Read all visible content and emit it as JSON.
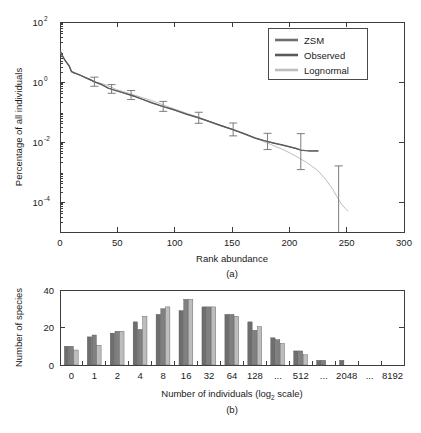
{
  "figure": {
    "panel_a_caption": "(a)",
    "panel_b_caption": "(b)"
  },
  "chart_data": [
    {
      "type": "line",
      "panel": "a",
      "title": "",
      "xlabel": "Rank abundance",
      "ylabel": "Percentage of all individuals",
      "xlim": [
        0,
        300
      ],
      "ylim": [
        1e-05,
        100
      ],
      "yscale": "log",
      "grid": false,
      "legend_position": "upper-right",
      "xticks": [
        0,
        50,
        100,
        150,
        200,
        250,
        300
      ],
      "xticklabels": [
        "0",
        "50",
        "100",
        "150",
        "200",
        "250",
        "300"
      ],
      "yticks": [
        100,
        1,
        0.01,
        0.0001
      ],
      "yticklabels": [
        "10^2",
        "10^0",
        "10^-2",
        "10^-4"
      ],
      "yticklabel_parts": [
        {
          "base": "10",
          "exp": "2"
        },
        {
          "base": "10",
          "exp": "0"
        },
        {
          "base": "10",
          "exp": "-2"
        },
        {
          "base": "10",
          "exp": "-4"
        }
      ],
      "series": [
        {
          "name": "ZSM",
          "color": "#6e6e6e",
          "x": [
            0,
            2,
            4,
            6,
            8,
            10,
            12,
            14,
            18,
            22,
            26,
            30,
            36,
            42,
            48,
            56,
            64,
            72,
            80,
            90,
            100,
            110,
            120,
            130,
            140,
            150,
            160,
            170,
            178,
            186,
            194,
            200,
            206,
            210,
            214,
            218,
            222,
            225
          ],
          "y": [
            11.0,
            7.5,
            5.5,
            4.3,
            3.4,
            2.2,
            2.0,
            1.9,
            1.65,
            1.4,
            1.2,
            1.0,
            0.82,
            0.62,
            0.52,
            0.42,
            0.34,
            0.26,
            0.2,
            0.15,
            0.115,
            0.085,
            0.065,
            0.048,
            0.035,
            0.026,
            0.019,
            0.0135,
            0.011,
            0.0092,
            0.0078,
            0.0068,
            0.006,
            0.0053,
            0.0051,
            0.005,
            0.005,
            0.005
          ]
        },
        {
          "name": "Observed",
          "color": "#5a5a5a",
          "x": [
            0,
            2,
            4,
            6,
            8,
            10,
            12,
            14,
            18,
            22,
            26,
            30,
            36,
            42,
            48,
            56,
            64,
            72,
            80,
            90,
            100,
            110,
            120,
            130,
            140,
            150,
            160,
            170,
            178,
            186,
            194,
            200,
            206,
            210,
            214,
            218,
            222,
            225
          ],
          "y": [
            11.5,
            7.8,
            5.6,
            4.4,
            3.5,
            2.25,
            2.05,
            1.92,
            1.68,
            1.42,
            1.22,
            1.02,
            0.84,
            0.63,
            0.53,
            0.43,
            0.345,
            0.265,
            0.205,
            0.152,
            0.117,
            0.086,
            0.066,
            0.049,
            0.036,
            0.027,
            0.0195,
            0.0138,
            0.0112,
            0.0094,
            0.008,
            0.007,
            0.0061,
            0.0054,
            0.0052,
            0.0051,
            0.0051,
            0.0051
          ]
        },
        {
          "name": "Lognormal",
          "color": "#bdbdbd",
          "x": [
            0,
            2,
            4,
            6,
            8,
            10,
            14,
            20,
            30,
            40,
            50,
            60,
            80,
            100,
            120,
            140,
            160,
            180,
            195,
            205,
            215,
            225,
            232,
            238,
            243,
            246,
            249,
            251
          ],
          "y": [
            10.5,
            7.2,
            5.3,
            4.2,
            3.3,
            2.3,
            1.95,
            1.55,
            1.05,
            0.8,
            0.55,
            0.42,
            0.24,
            0.125,
            0.068,
            0.036,
            0.019,
            0.0095,
            0.0055,
            0.0035,
            0.0021,
            0.0011,
            0.00055,
            0.00026,
            0.00012,
            8e-05,
            6e-05,
            5e-05
          ]
        }
      ],
      "errorbars": [
        {
          "x": 30,
          "y": 1.0,
          "low": 0.72,
          "high": 1.45
        },
        {
          "x": 45,
          "y": 0.58,
          "low": 0.42,
          "high": 0.82
        },
        {
          "x": 62,
          "y": 0.36,
          "low": 0.26,
          "high": 0.52
        },
        {
          "x": 90,
          "y": 0.15,
          "low": 0.105,
          "high": 0.225
        },
        {
          "x": 121,
          "y": 0.063,
          "low": 0.042,
          "high": 0.098
        },
        {
          "x": 151,
          "y": 0.026,
          "low": 0.016,
          "high": 0.043
        },
        {
          "x": 181,
          "y": 0.0105,
          "low": 0.0056,
          "high": 0.0195
        },
        {
          "x": 210,
          "y": 0.0053,
          "low": 0.0012,
          "high": 0.019
        },
        {
          "x": 243,
          "y": 0.00022,
          "low": 1.1e-06,
          "high": 0.0016
        }
      ]
    },
    {
      "type": "bar",
      "panel": "b",
      "title": "",
      "xlabel": "Number of individuals (log2 scale)",
      "xlabel_parts": {
        "pre": "Number of individuals (log",
        "sub": "2",
        "post": " scale)"
      },
      "ylabel": "Number of species",
      "ylim": [
        0,
        40
      ],
      "yticks": [
        0,
        20,
        40
      ],
      "yticklabels": [
        "0",
        "20",
        "40"
      ],
      "grid": false,
      "categories": [
        "0",
        "1",
        "2",
        "4",
        "8",
        "16",
        "32",
        "64",
        "128",
        "...",
        "512",
        "...",
        "2048",
        "...",
        "8192"
      ],
      "series": [
        {
          "name": "ZSM",
          "color": "#6e6e6e",
          "values": [
            10,
            15,
            17,
            23,
            27,
            29,
            31,
            27,
            23,
            14.5,
            7.5,
            2.5,
            2.5,
            0,
            0
          ]
        },
        {
          "name": "Observed",
          "color": "#808080",
          "values": [
            10,
            16,
            18,
            19,
            30,
            35,
            31,
            27,
            18.5,
            13.5,
            7.5,
            2.5,
            0,
            0,
            0
          ]
        },
        {
          "name": "Lognormal",
          "color": "#bdbdbd",
          "values": [
            8,
            10.5,
            18,
            26,
            31,
            35,
            31,
            26,
            20.5,
            11.5,
            5.5,
            0,
            0,
            0,
            0
          ]
        }
      ]
    }
  ],
  "legend": {
    "items": [
      {
        "label": "ZSM",
        "color": "#6e6e6e"
      },
      {
        "label": "Observed",
        "color": "#5a5a5a"
      },
      {
        "label": "Lognormal",
        "color": "#bdbdbd"
      }
    ]
  }
}
